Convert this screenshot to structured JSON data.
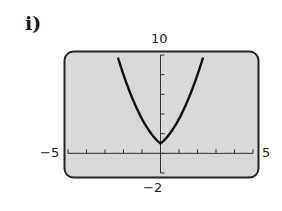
{
  "figure_label": "i)",
  "window": {
    "ymax_label": "10",
    "ymin_label": "−2",
    "xmin_label": "−5",
    "xmax_label": "5"
  },
  "colors": {
    "screen_bg": "#d9d9d9",
    "border": "#222222",
    "curve": "#111111"
  },
  "chart_data": {
    "type": "line",
    "title": "i)",
    "xlabel": "",
    "ylabel": "",
    "xlim": [
      -5,
      5
    ],
    "ylim": [
      -2,
      10
    ],
    "xticks_step": 1,
    "yticks_step": 2,
    "grid": false,
    "legend": null,
    "annotations": [
      "10",
      "−2",
      "−5",
      "5"
    ],
    "series": [
      {
        "name": "curve",
        "x": [
          -2.3,
          -2.0,
          -1.75,
          -1.5,
          -1.25,
          -1.0,
          -0.75,
          -0.5,
          -0.25,
          0,
          0.25,
          0.5,
          0.75,
          1.0,
          1.25,
          1.5,
          1.75,
          2.0,
          2.3
        ],
        "values": [
          9.74,
          8.0,
          6.69,
          5.5,
          4.44,
          3.5,
          2.69,
          2.0,
          1.44,
          1.0,
          1.44,
          2.0,
          2.69,
          3.5,
          4.44,
          5.5,
          6.69,
          8.0,
          9.74
        ]
      }
    ]
  }
}
